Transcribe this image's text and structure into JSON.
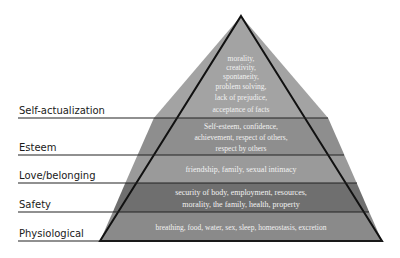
{
  "diagram": {
    "type": "pyramid",
    "levels": [
      {
        "name": "Self-actualization",
        "color": "#a3a3a3",
        "text_lines": [
          "morality,",
          "creativity,",
          "spontaneity,",
          "problem solving,",
          "lack of prejudice,",
          "acceptance of facts"
        ]
      },
      {
        "name": "Esteem",
        "color": "#8e8e8e",
        "text_lines": [
          "Self-esteem, confidence,",
          "achievement, respect of others,",
          "respect by others"
        ]
      },
      {
        "name": "Love/belonging",
        "color": "#9a9a9a",
        "text_lines": [
          "friendship, family, sexual intimacy"
        ]
      },
      {
        "name": "Safety",
        "color": "#6f6f6f",
        "text_lines": [
          "security of body, employment, resources,",
          "morality, the family, health, property"
        ]
      },
      {
        "name": "Physiological",
        "color": "#8a8a8a",
        "text_lines": [
          "breathing, food, water, sex, sleep, homeostasis, excretion"
        ]
      }
    ]
  }
}
